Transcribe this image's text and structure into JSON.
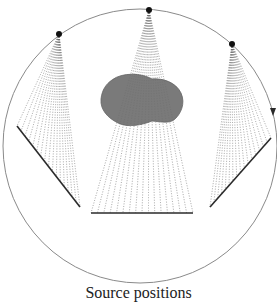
{
  "caption": "Source positions",
  "colors": {
    "circle": "#8a8a8a",
    "object": "#7a7a7a",
    "object_stroke": "#666666",
    "detector": "#2a2a2a",
    "rays": "#9a9a9a",
    "source": "#111111"
  },
  "circle": {
    "cx": 140,
    "cy": 146,
    "r": 137
  },
  "sources": [
    {
      "id": "source-left",
      "x": 59,
      "y": 34
    },
    {
      "id": "source-top",
      "x": 149,
      "y": 10
    },
    {
      "id": "source-right",
      "x": 232,
      "y": 44
    }
  ],
  "detectors": [
    {
      "id": "detector-left",
      "x1": 17,
      "y1": 126,
      "x2": 80,
      "y2": 207
    },
    {
      "id": "detector-bottom",
      "x1": 91,
      "y1": 213,
      "x2": 193,
      "y2": 213
    },
    {
      "id": "detector-right",
      "x1": 271,
      "y1": 138,
      "x2": 210,
      "y2": 207
    }
  ],
  "rotation_arrow": {
    "x": 273,
    "y": 113,
    "direction": "clockwise"
  },
  "object_label": "object"
}
